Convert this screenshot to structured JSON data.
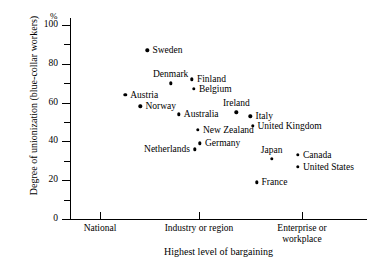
{
  "chart_data": {
    "type": "scatter",
    "title": "",
    "xlabel": "Highest level of bargaining",
    "ylabel": "Degree of unionization (blue-collar workers)",
    "y_unit": "%",
    "ylim": [
      0,
      100
    ],
    "y_major_ticks": [
      "0",
      "20",
      "40",
      "60",
      "80",
      "100"
    ],
    "y_minor_ticks": [
      10,
      30,
      50,
      70,
      90
    ],
    "x_categories": [
      "National",
      "Industry or region",
      "Enterprise or\nworkplace"
    ],
    "grid": false,
    "legend": "none",
    "points": [
      {
        "name": "Sweden",
        "x": 1.47,
        "y": 87,
        "label_pos": "right"
      },
      {
        "name": "Denmark",
        "x": 1.7,
        "y": 70,
        "label_pos": "above"
      },
      {
        "name": "Finland",
        "x": 1.91,
        "y": 72,
        "label_pos": "right"
      },
      {
        "name": "Belgium",
        "x": 1.93,
        "y": 67,
        "label_pos": "right"
      },
      {
        "name": "Austria",
        "x": 1.25,
        "y": 64,
        "label_pos": "right"
      },
      {
        "name": "Norway",
        "x": 1.4,
        "y": 58,
        "label_pos": "right"
      },
      {
        "name": "Australia",
        "x": 1.78,
        "y": 54,
        "label_pos": "right"
      },
      {
        "name": "Ireland",
        "x": 2.35,
        "y": 55,
        "label_pos": "above"
      },
      {
        "name": "Italy",
        "x": 2.49,
        "y": 53,
        "label_pos": "right"
      },
      {
        "name": "United Kingdom",
        "x": 2.51,
        "y": 48,
        "label_pos": "right"
      },
      {
        "name": "New Zealand",
        "x": 1.97,
        "y": 46,
        "label_pos": "right"
      },
      {
        "name": "Germany",
        "x": 1.99,
        "y": 39,
        "label_pos": "right"
      },
      {
        "name": "Netherlands",
        "x": 1.94,
        "y": 36,
        "label_pos": "left"
      },
      {
        "name": "Japan",
        "x": 2.7,
        "y": 31,
        "label_pos": "above"
      },
      {
        "name": "Canada",
        "x": 2.96,
        "y": 33,
        "label_pos": "right"
      },
      {
        "name": "United States",
        "x": 2.96,
        "y": 27,
        "label_pos": "right"
      },
      {
        "name": "France",
        "x": 2.55,
        "y": 19,
        "label_pos": "right"
      }
    ]
  }
}
